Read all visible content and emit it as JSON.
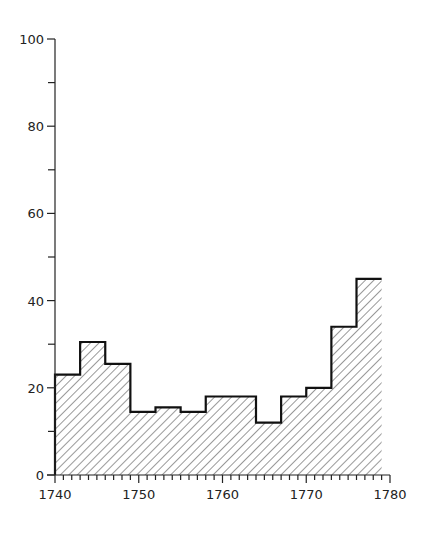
{
  "chart_data": {
    "type": "bar",
    "style": "histogram-step",
    "title": "",
    "xlabel": "",
    "ylabel": "",
    "xlim": [
      1740,
      1780
    ],
    "ylim": [
      0,
      100
    ],
    "bin_width_years": 3,
    "bins": [
      {
        "start": 1740,
        "end": 1743,
        "value": 23
      },
      {
        "start": 1743,
        "end": 1746,
        "value": 30.5
      },
      {
        "start": 1746,
        "end": 1749,
        "value": 25.5
      },
      {
        "start": 1749,
        "end": 1752,
        "value": 14.5
      },
      {
        "start": 1752,
        "end": 1755,
        "value": 15.5
      },
      {
        "start": 1755,
        "end": 1758,
        "value": 14.5
      },
      {
        "start": 1758,
        "end": 1761,
        "value": 18
      },
      {
        "start": 1761,
        "end": 1764,
        "value": 18
      },
      {
        "start": 1764,
        "end": 1767,
        "value": 12
      },
      {
        "start": 1767,
        "end": 1770,
        "value": 18
      },
      {
        "start": 1770,
        "end": 1773,
        "value": 20
      },
      {
        "start": 1773,
        "end": 1776,
        "value": 34
      },
      {
        "start": 1776,
        "end": 1779,
        "value": 45
      }
    ],
    "x_tick_labels": [
      "1740",
      "1750",
      "1760",
      "1770",
      "1780"
    ],
    "x_ticks": [
      1740,
      1750,
      1760,
      1770,
      1780
    ],
    "x_minor_tick_step": 1,
    "y_tick_labels": [
      "0",
      "20",
      "40",
      "60",
      "80",
      "100"
    ],
    "y_ticks": [
      0,
      20,
      40,
      60,
      80,
      100
    ],
    "y_minor_ticks": [
      10,
      30,
      50,
      70,
      90
    ],
    "grid": false,
    "legend": null,
    "fill": "diagonal-hatch"
  }
}
